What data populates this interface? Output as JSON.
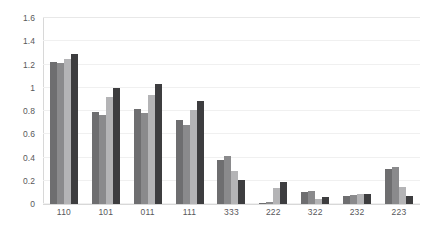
{
  "chart_data": {
    "type": "bar",
    "title": "",
    "subtitle": "",
    "xlabel": "",
    "ylabel": "",
    "ylim": [
      0,
      1.6
    ],
    "yticks": [
      "0",
      "0.2",
      "0.4",
      "0.6",
      "0.8",
      "1",
      "1.2",
      "1.4",
      "1.6"
    ],
    "ytick_values": [
      0,
      0.2,
      0.4,
      0.6,
      0.8,
      1.0,
      1.2,
      1.4,
      1.6
    ],
    "grid": "horizontal",
    "legend": "none",
    "categories": [
      "110",
      "101",
      "011",
      "111",
      "333",
      "222",
      "322",
      "232",
      "223"
    ],
    "series": [
      {
        "name": "series-1",
        "color": "#6e6e70",
        "values": [
          1.22,
          0.79,
          0.82,
          0.72,
          0.38,
          0.01,
          0.1,
          0.07,
          0.3
        ]
      },
      {
        "name": "series-2",
        "color": "#8a8a8c",
        "values": [
          1.21,
          0.77,
          0.78,
          0.68,
          0.41,
          0.02,
          0.11,
          0.08,
          0.32
        ]
      },
      {
        "name": "series-3",
        "color": "#b4b4b6",
        "values": [
          1.25,
          0.92,
          0.94,
          0.81,
          0.28,
          0.14,
          0.04,
          0.09,
          0.15
        ]
      },
      {
        "name": "series-4",
        "color": "#3d3d3f",
        "values": [
          1.29,
          1.0,
          1.03,
          0.89,
          0.21,
          0.19,
          0.06,
          0.09,
          0.07
        ]
      }
    ]
  }
}
